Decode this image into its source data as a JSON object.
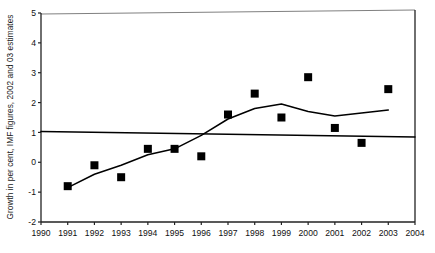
{
  "chart_data": {
    "type": "scatter",
    "title": "",
    "xlabel": "",
    "ylabel": "Growth in per cent, IMF figures, 2002 and 03 estimates",
    "xlim": [
      1990,
      2004
    ],
    "ylim": [
      -2,
      5
    ],
    "xticks": [
      "1990",
      "1991",
      "1992",
      "1993",
      "1994",
      "1995",
      "1996",
      "1997",
      "1998",
      "1999",
      "2000",
      "2001",
      "2002",
      "2003",
      "2004"
    ],
    "yticks": [
      "5",
      "4",
      "3",
      "2",
      "1",
      "0",
      "-1",
      "-2"
    ],
    "grid": false,
    "legend": "none",
    "x": [
      1991,
      1992,
      1993,
      1994,
      1995,
      1996,
      1997,
      1998,
      1999,
      2000,
      2001,
      2002,
      2003
    ],
    "series": [
      {
        "name": "Growth (IMF figures, 2002 and 03 estimates)",
        "marker": "filled-square",
        "color": "#000000",
        "values": [
          -0.8,
          -0.1,
          -0.5,
          0.45,
          0.45,
          0.2,
          1.6,
          2.3,
          1.5,
          2.85,
          1.15,
          0.65,
          2.45
        ]
      },
      {
        "name": "Trend line",
        "marker": "none",
        "color": "#000000",
        "x": [
          1991,
          1992,
          1993,
          1994,
          1995,
          1996,
          1997,
          1998,
          1999,
          2000,
          2001,
          2002,
          2003
        ],
        "values": [
          -0.85,
          -0.4,
          -0.1,
          0.25,
          0.45,
          0.9,
          1.45,
          1.8,
          1.95,
          1.7,
          1.55,
          1.65,
          1.75
        ]
      },
      {
        "name": "Reference line",
        "marker": "none",
        "color": "#000000",
        "x": [
          1990,
          2004
        ],
        "values": [
          1.03,
          0.85
        ]
      }
    ]
  }
}
